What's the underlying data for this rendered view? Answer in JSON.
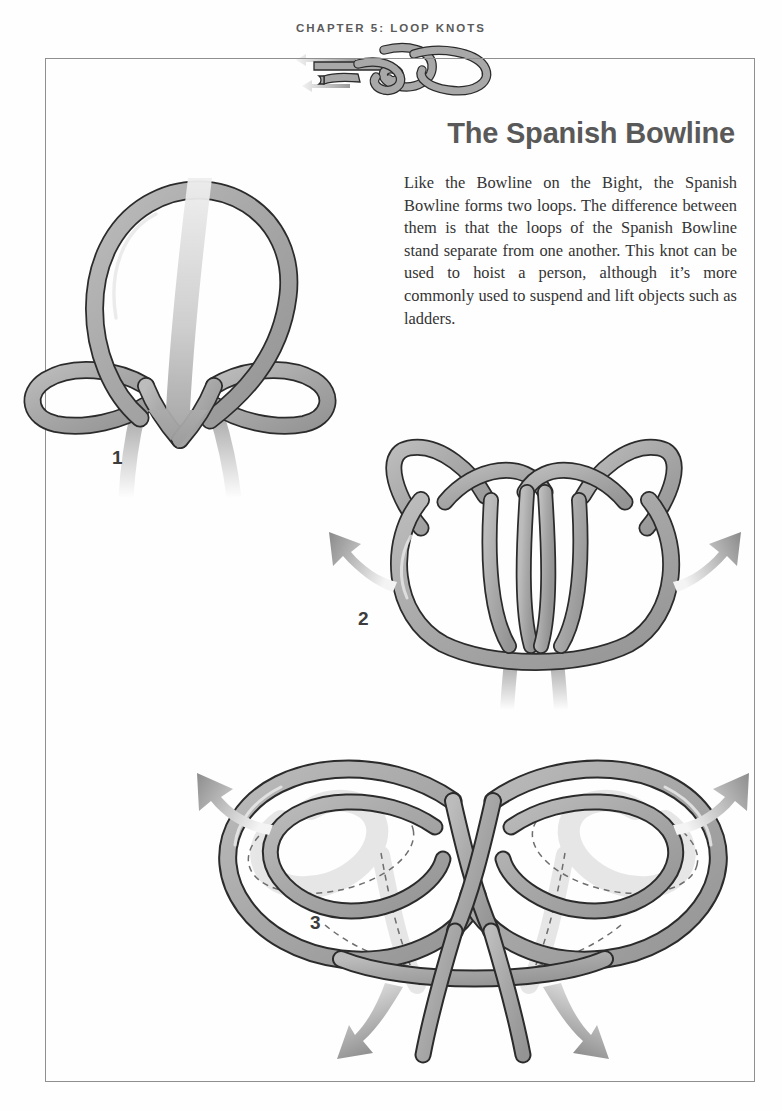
{
  "page": {
    "chapter_header": "CHAPTER 5: LOOP KNOTS",
    "title": "The Spanish Bowline",
    "intro": "Like the Bowline on the Bight, the Spanish Bowline forms two loops. The difference between them is that the loops of the Spanish Bowline stand separate from one another. This knot can be used to hoist a person, although it’s more commonly used to suspend and lift objects such as ladders."
  },
  "colors": {
    "rope_fill": "#a8a8a8",
    "rope_fill_light": "#c9c9c9",
    "rope_fill_dark": "#8d8d8d",
    "rope_outline": "#2b2b2b",
    "arrow_dark": "#8a8a8a",
    "arrow_light": "#efefef",
    "border": "#8f8f8f",
    "header_text": "#5b5b5b",
    "title_text": "#595959",
    "body_text": "#343434",
    "step_number": "#3c3c3c",
    "background": "#ffffff"
  },
  "steps": [
    {
      "number": "1",
      "caption": "",
      "description": "Large top loop with two small side bights and a downward arrow through the center"
    },
    {
      "number": "2",
      "caption": "",
      "description": "Knot with two upper ear loops, central crossing and two hanging ends; arrows pull outward left and right"
    },
    {
      "number": "3",
      "caption": "",
      "description": "Two separate large loops shown with dashed hidden rope paths; arrows pull outward left, right and down on both ends"
    }
  ],
  "header_graphic": {
    "name": "decorative-knot",
    "arrows": 2
  }
}
